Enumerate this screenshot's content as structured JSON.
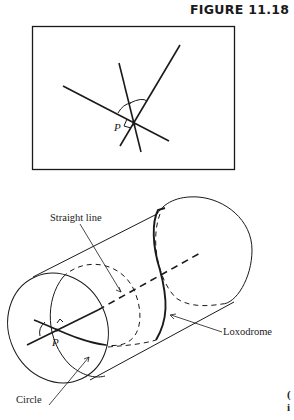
{
  "figure": {
    "title": "FIGURE 11.18",
    "panel_top": {
      "description": "Three lines intersecting at point P in a rectangle, with angle arcs and a right-angle mark",
      "point_label": "P"
    },
    "panel_bottom": {
      "description": "Cylinder showing a straight line (axis), a circle, and a loxodrome through point P",
      "point_label": "P",
      "labels": {
        "straight_line": "Straight line",
        "loxodrome": "Loxodrome",
        "circle": "Circle"
      }
    },
    "edge_fragment": [
      "(",
      "i"
    ]
  },
  "colors": {
    "ink": "#1a1a1a",
    "background": "#ffffff"
  }
}
